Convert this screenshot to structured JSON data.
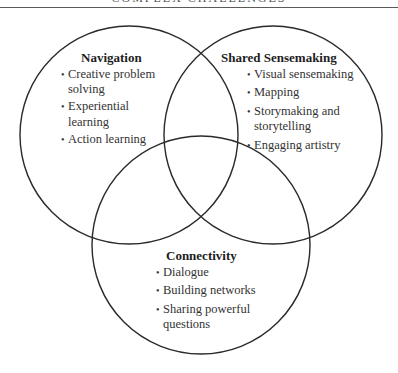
{
  "header": {
    "text": "COMPLEX CHALLENGES"
  },
  "diagram": {
    "type": "venn",
    "stroke_color": "#2a2a2a",
    "circles": [
      {
        "id": "navigation",
        "cx": 129,
        "cy": 135,
        "r": 109
      },
      {
        "id": "shared-sensemaking",
        "cx": 273,
        "cy": 135,
        "r": 109
      },
      {
        "id": "connectivity",
        "cx": 201,
        "cy": 245,
        "r": 109
      }
    ],
    "groups": {
      "navigation": {
        "title": "Navigation",
        "items": [
          {
            "line1": "Creative problem",
            "line2": "solving"
          },
          {
            "line1": "Experiential",
            "line2": "learning"
          },
          {
            "line1": "Action learning",
            "line2": ""
          }
        ]
      },
      "shared_sensemaking": {
        "title": "Shared Sensemaking",
        "items": [
          {
            "line1": "Visual sensemaking",
            "line2": ""
          },
          {
            "line1": "Mapping",
            "line2": ""
          },
          {
            "line1": "Storymaking and",
            "line2": "storytelling"
          },
          {
            "line1": "Engaging artistry",
            "line2": ""
          }
        ]
      },
      "connectivity": {
        "title": "Connectivity",
        "items": [
          {
            "line1": "Dialogue",
            "line2": ""
          },
          {
            "line1": "Building networks",
            "line2": ""
          },
          {
            "line1": "Sharing powerful",
            "line2": "questions"
          }
        ]
      }
    }
  }
}
